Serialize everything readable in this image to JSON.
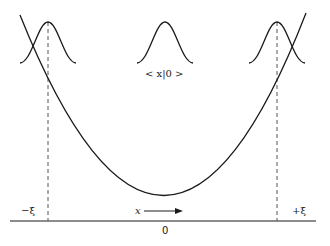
{
  "figure": {
    "labels": {
      "center_state": "< x|0 >",
      "left_turning_point": "−ξ",
      "right_turning_point": "+ξ",
      "axis_variable": "x",
      "origin": "0"
    },
    "colors": {
      "curve": "#1a1a1a",
      "dashed": "#555555",
      "background": "#ffffff"
    },
    "geometry": {
      "baseline_y": 221,
      "baseline_x": [
        10,
        316
      ],
      "left_dashed_x": 48,
      "right_dashed_x": 277,
      "parabola_min": [
        165,
        196
      ],
      "gaussian_peaks_x": [
        48,
        165,
        277
      ],
      "gaussian_peak_y": 22,
      "gaussian_base_y": 63
    }
  }
}
